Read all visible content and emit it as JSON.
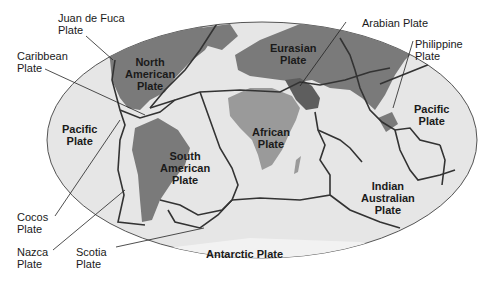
{
  "map": {
    "title": "Tectonic Plates of the World",
    "colors": {
      "ocean": "#e6e6e6",
      "land_major": "#7a7a7a",
      "land_africa": "#9a9a9a",
      "land_arabia": "#5e5e5e",
      "boundary": "#333333",
      "outline": "#555555",
      "leader_line": "#222222"
    },
    "labels": {
      "juan_de_fuca": "Juan de Fuca\nPlate",
      "caribbean": "Caribbean\nPlate",
      "north_american": "North\nAmerican\nPlate",
      "eurasian": "Eurasian\nPlate",
      "arabian": "Arabian Plate",
      "philippine": "Philippine\nPlate",
      "pacific_west": "Pacific\nPlate",
      "pacific_east": "Pacific\nPlate",
      "african": "African\nPlate",
      "south_american": "South\nAmerican\nPlate",
      "indian_australian": "Indian\nAustralian\nPlate",
      "cocos": "Cocos\nPlate",
      "nazca": "Nazca\nPlate",
      "scotia": "Scotia\nPlate",
      "antarctic": "Antarctic Plate"
    }
  }
}
